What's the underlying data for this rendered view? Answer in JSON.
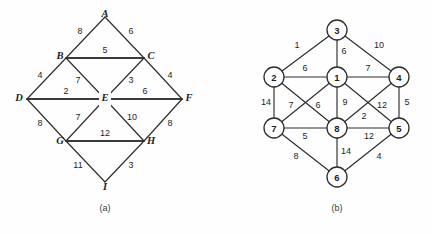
{
  "figure": {
    "background_color": "#fefefe",
    "stroke_color": "#2c2c2c",
    "panels": [
      {
        "id": "panel-a",
        "caption": "(a)",
        "caption_pos": [
          105,
          209
        ],
        "node_shape": "none",
        "nodes": [
          {
            "id": "A",
            "label": "A",
            "x": 105,
            "y": 17,
            "label_dx": 0,
            "label_dy": -1
          },
          {
            "id": "B",
            "label": "B",
            "x": 66,
            "y": 58,
            "label_dx": -6,
            "label_dy": -1
          },
          {
            "id": "C",
            "label": "C",
            "x": 144,
            "y": 58,
            "label_dx": 7,
            "label_dy": -1
          },
          {
            "id": "D",
            "label": "D",
            "x": 27,
            "y": 99,
            "label_dx": -7,
            "label_dy": 0
          },
          {
            "id": "E",
            "label": "E",
            "x": 105,
            "y": 99,
            "label_dx": 0,
            "label_dy": 0
          },
          {
            "id": "F",
            "label": "F",
            "x": 182,
            "y": 99,
            "label_dx": 7,
            "label_dy": 0
          },
          {
            "id": "G",
            "label": "G",
            "x": 66,
            "y": 141,
            "label_dx": -6,
            "label_dy": 1
          },
          {
            "id": "H",
            "label": "H",
            "x": 144,
            "y": 141,
            "label_dx": 7,
            "label_dy": 1
          },
          {
            "id": "I",
            "label": "I",
            "x": 105,
            "y": 182,
            "label_dx": 0,
            "label_dy": 5
          }
        ],
        "edges": [
          {
            "from": "A",
            "to": "B",
            "weight": "8",
            "lx": 80,
            "ly": 32,
            "thick": false
          },
          {
            "from": "A",
            "to": "C",
            "weight": "6",
            "lx": 131,
            "ly": 32,
            "thick": false
          },
          {
            "from": "B",
            "to": "C",
            "weight": "5",
            "lx": 105,
            "ly": 51,
            "thick": true
          },
          {
            "from": "B",
            "to": "D",
            "weight": "4",
            "lx": 40,
            "ly": 76,
            "thick": false
          },
          {
            "from": "B",
            "to": "E",
            "weight": "7",
            "lx": 78,
            "ly": 81,
            "thick": false
          },
          {
            "from": "C",
            "to": "E",
            "weight": "3",
            "lx": 131,
            "ly": 81,
            "thick": false
          },
          {
            "from": "C",
            "to": "F",
            "weight": "4",
            "lx": 170,
            "ly": 76,
            "thick": false
          },
          {
            "from": "D",
            "to": "E",
            "weight": "2",
            "lx": 66,
            "ly": 92,
            "thick": true
          },
          {
            "from": "E",
            "to": "F",
            "weight": "6",
            "lx": 145,
            "ly": 92,
            "thick": true
          },
          {
            "from": "D",
            "to": "G",
            "weight": "8",
            "lx": 40,
            "ly": 124,
            "thick": false
          },
          {
            "from": "E",
            "to": "G",
            "weight": "7",
            "lx": 78,
            "ly": 118,
            "thick": false
          },
          {
            "from": "E",
            "to": "H",
            "weight": "10",
            "lx": 132,
            "ly": 118,
            "thick": false
          },
          {
            "from": "F",
            "to": "H",
            "weight": "8",
            "lx": 170,
            "ly": 124,
            "thick": false
          },
          {
            "from": "G",
            "to": "H",
            "weight": "12",
            "lx": 105,
            "ly": 134,
            "thick": true
          },
          {
            "from": "G",
            "to": "I",
            "weight": "11",
            "lx": 78,
            "ly": 166,
            "thick": false
          },
          {
            "from": "H",
            "to": "I",
            "weight": "3",
            "lx": 131,
            "ly": 166,
            "thick": false
          }
        ]
      },
      {
        "id": "panel-b",
        "caption": "(b)",
        "caption_pos": [
          337,
          209
        ],
        "node_shape": "circle",
        "node_radius": 10,
        "nodes": [
          {
            "id": "3",
            "label": "3",
            "x": 337,
            "y": 30
          },
          {
            "id": "2",
            "label": "2",
            "x": 274,
            "y": 77
          },
          {
            "id": "1",
            "label": "1",
            "x": 337,
            "y": 77
          },
          {
            "id": "4",
            "label": "4",
            "x": 399,
            "y": 77
          },
          {
            "id": "7",
            "label": "7",
            "x": 274,
            "y": 128
          },
          {
            "id": "8",
            "label": "8",
            "x": 337,
            "y": 128
          },
          {
            "id": "5",
            "label": "5",
            "x": 399,
            "y": 128
          },
          {
            "id": "6",
            "label": "6",
            "x": 337,
            "y": 177
          }
        ],
        "edges": [
          {
            "from": "3",
            "to": "2",
            "weight": "1",
            "lx": 297,
            "ly": 46
          },
          {
            "from": "3",
            "to": "1",
            "weight": "6",
            "lx": 344,
            "ly": 52
          },
          {
            "from": "3",
            "to": "4",
            "weight": "10",
            "lx": 379,
            "ly": 46
          },
          {
            "from": "2",
            "to": "1",
            "weight": "6",
            "lx": 305,
            "ly": 70
          },
          {
            "from": "1",
            "to": "4",
            "weight": "7",
            "lx": 368,
            "ly": 70
          },
          {
            "from": "2",
            "to": "7",
            "weight": "14",
            "lx": 266,
            "ly": 103
          },
          {
            "from": "7",
            "to": "1",
            "weight": "7",
            "lx": 291,
            "ly": 106
          },
          {
            "from": "2",
            "to": "8",
            "weight": "6",
            "lx": 318,
            "ly": 106
          },
          {
            "from": "1",
            "to": "8",
            "weight": "9",
            "lx": 344,
            "ly": 103
          },
          {
            "from": "4",
            "to": "8",
            "weight": "12",
            "lx": 382,
            "ly": 106
          },
          {
            "from": "4",
            "to": "5",
            "weight": "5",
            "lx": 407,
            "ly": 103
          },
          {
            "from": "8",
            "to": "5",
            "weight": "2",
            "lx": 364,
            "ly": 117
          },
          {
            "from": "7",
            "to": "8",
            "weight": "5",
            "lx": 305,
            "ly": 136
          },
          {
            "from": "8",
            "to": "5b",
            "weight": "12",
            "lx": 368,
            "ly": 136
          },
          {
            "from": "7",
            "to": "6",
            "weight": "8",
            "lx": 296,
            "ly": 157
          },
          {
            "from": "8",
            "to": "6",
            "weight": "14",
            "lx": 345,
            "ly": 153
          },
          {
            "from": "6",
            "to": "5",
            "weight": "4",
            "lx": 379,
            "ly": 157
          }
        ]
      }
    ]
  }
}
